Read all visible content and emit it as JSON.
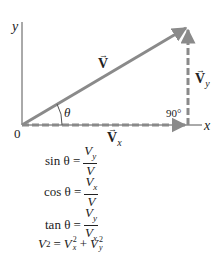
{
  "diagram": {
    "axes": {
      "x_label": "x",
      "y_label": "y",
      "origin_label": "0"
    },
    "vectors": {
      "resultant": {
        "label": "V",
        "arrow": "→"
      },
      "x_component": {
        "label": "V",
        "subscript": "x",
        "arrow": "→"
      },
      "y_component": {
        "label": "V",
        "subscript": "y",
        "arrow": "→"
      }
    },
    "angle_label": "θ",
    "right_angle_label": "90°",
    "colors": {
      "vector": "#8a8a8a",
      "axis": "#555555",
      "text": "#222222"
    }
  },
  "equations": {
    "sin": {
      "lhs": "sin θ =",
      "num": "V",
      "num_sub": "y",
      "den": "V",
      "den_sub": ""
    },
    "cos": {
      "lhs": "cos θ =",
      "num": "V",
      "num_sub": "x",
      "den": "V",
      "den_sub": ""
    },
    "tan": {
      "lhs": "tan θ =",
      "num": "V",
      "num_sub": "y",
      "den": "V",
      "den_sub": "x"
    },
    "pyth": {
      "lhs": "V",
      "lhs_sup": "2",
      "eq": "=",
      "t1": "V",
      "t1_sup": "2",
      "t1_sub": "x",
      "plus": "+",
      "t2": "V",
      "t2_sup": "2",
      "t2_sub": "y"
    }
  }
}
